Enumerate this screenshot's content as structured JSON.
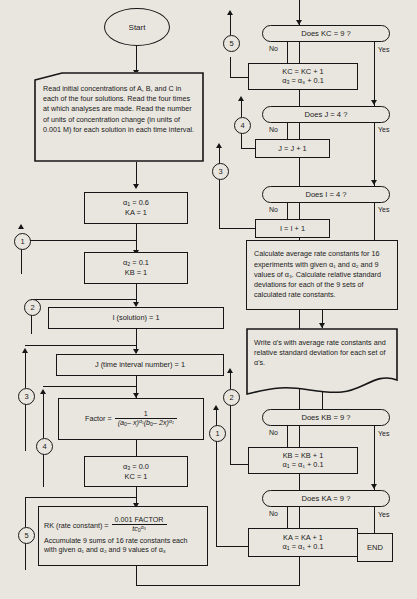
{
  "diagram": {
    "start": "Start"
  },
  "left_column": {
    "read_box": "Read initial concentrations of A, B, and C in each of the four solutions. Read the four times at which analyses are made. Read the number of units of concentration change (in units of 0.001 M) for each solution in each time interval.",
    "alpha1_box": {
      "line1_sym": "α",
      "line1_sub": "1",
      "line1_val": "= 0.6",
      "line2": "KA = 1"
    },
    "alpha2_box": {
      "line1_sym": "α",
      "line1_sub": "2",
      "line1_val": "= 0.1",
      "line2": "KB = 1"
    },
    "i_solution_box": "I  (solution) = 1",
    "j_interval_box": "J  (time interval number) = 1",
    "factor_box": {
      "label": "Factor =",
      "numerator": "1",
      "denominator_a": "(a",
      "denominator_a_sub": "0",
      "denominator_a_rest": "– x)",
      "denominator_a_exp": "α₁",
      "denominator_b": "(b",
      "denominator_b_sub": "0",
      "denominator_b_rest": "– 2x)",
      "denominator_b_exp": "α₂"
    },
    "alpha3_box": {
      "line1_sym": "α",
      "line1_sub": "3",
      "line1_val": "= 0.0",
      "line2": "KC = 1"
    },
    "rk_box": {
      "label": "RK (rate constant) =",
      "numerator": "0.001 FACTOR",
      "denominator_t": "t",
      "denominator_c": "c",
      "denominator_c_sub": "0",
      "denominator_c_exp": "α₃",
      "text": "Accumulate 9 sums of 16 rate constants each with given α₁ and α₂ and 9 values of α₃"
    }
  },
  "right_column": {
    "dec_kc": "Does KC = 9 ?",
    "kc_box": {
      "line1": "KC = KC + 1",
      "line2_sym": "α",
      "line2_sub": "3",
      "line2_rest": "= α₃ + 0.1"
    },
    "dec_j": "Does J = 4 ?",
    "j_box": "J = J + 1",
    "dec_i": "Does I = 4 ?",
    "i_box": "I = I + 1",
    "calc_box": "Calculate average rate constants for 16 experiments with given α₁ and α₂ and 9 values of α₃. Calculate relative standard deviations for each of the 9 sets of calculated rate constants.",
    "write_box": "Write α's with average rate constants and relative standard deviation for each set of α's.",
    "dec_kb": "Does KB = 9 ?",
    "kb_box": {
      "line1": "KB = KB + 1",
      "line2_sym": "α",
      "line2_sub": "1",
      "line2_rest": "= α₁ + 0.1"
    },
    "dec_ka": "Does KA = 9 ?",
    "ka_box": {
      "line1": "KA = KA + 1",
      "line2_sym": "α",
      "line2_sub": "1",
      "line2_rest": "= α₁ + 0.1"
    },
    "end": "END"
  },
  "branch_labels": {
    "no": "No",
    "yes": "Yes"
  },
  "connectors": {
    "c1": "1",
    "c2": "2",
    "c3": "3",
    "c4": "4",
    "c5": "5"
  },
  "colors": {
    "ink": "#161616",
    "paper": "#e9e6df"
  }
}
